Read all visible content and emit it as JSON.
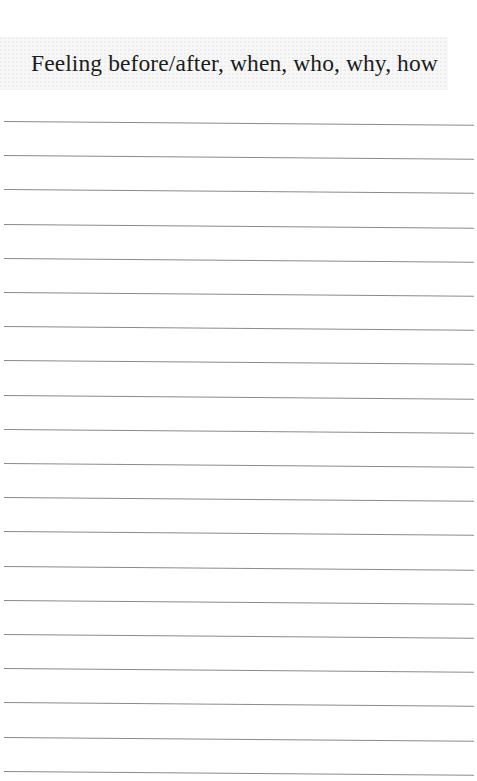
{
  "page": {
    "title": "Feeling before/after, when, who, why, how",
    "line_count": 20,
    "line_start_y": 121,
    "line_spacing": 34.2,
    "colors": {
      "background": "#ffffff",
      "title_band": "#f7f7f7",
      "title_text": "#1c1c1c",
      "rule": "#8a8a8a"
    }
  }
}
